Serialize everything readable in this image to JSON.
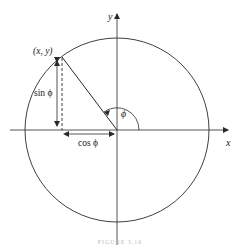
{
  "diagram": {
    "type": "unit-circle",
    "labels": {
      "x_axis": "x",
      "y_axis": "y",
      "point": "(x, y)",
      "angle": "ϕ",
      "sin": "sin ϕ",
      "cos": "cos ϕ"
    },
    "caption": "FIGURE 3.16",
    "colors": {
      "stroke": "#2a2a2a",
      "background": "#ffffff"
    }
  }
}
